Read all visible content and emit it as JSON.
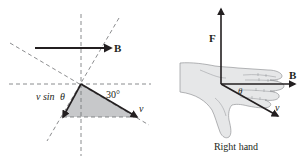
{
  "left_diagram": {
    "field_label": "B",
    "velocity_label": "v",
    "component_label_prefix": "v sin",
    "component_label_symbol": "θ",
    "angle_label": "30°"
  },
  "right_diagram": {
    "force_label": "F",
    "field_label": "B",
    "velocity_label": "v",
    "angle_label": "θ",
    "caption": "Right hand"
  },
  "colors": {
    "ink": "#231f20",
    "dash": "#6d6e71",
    "shade": "#c7c8ca",
    "hand_fill": "#e6e7e8",
    "hand_line": "#939598"
  }
}
